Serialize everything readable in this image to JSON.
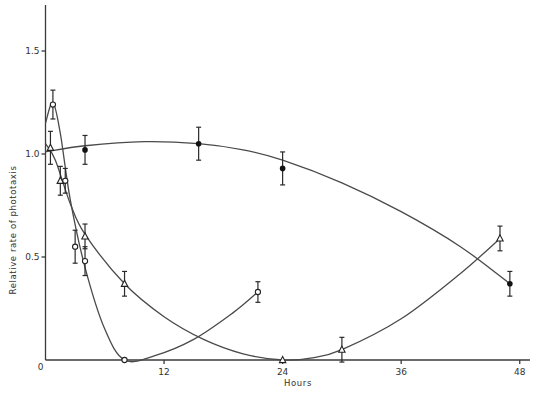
{
  "chart_data": {
    "type": "line",
    "title": "",
    "xlabel": "Hours",
    "ylabel": "Relative rate of phototaxis",
    "xlim": [
      0,
      49
    ],
    "ylim": [
      0,
      1.75
    ],
    "xticks": [
      0,
      12,
      24,
      36,
      48
    ],
    "xtick_labels": [
      "0",
      "12",
      "24",
      "36",
      "48"
    ],
    "yticks": [
      0,
      0.5,
      1.0,
      1.5
    ],
    "ytick_labels": [
      "0",
      "0.5",
      "1.0",
      "1.5"
    ],
    "grid": false,
    "legend": null,
    "series": [
      {
        "name": "open circles",
        "marker": "open-circle",
        "points": [
          {
            "x": 0.75,
            "y": 1.24,
            "err": 0.07
          },
          {
            "x": 2.0,
            "y": 0.87,
            "err": 0.06
          },
          {
            "x": 3.0,
            "y": 0.55,
            "err": 0.08
          },
          {
            "x": 4.0,
            "y": 0.48,
            "err": 0.07
          },
          {
            "x": 8.0,
            "y": 0.0,
            "err": 0.0
          },
          {
            "x": 21.5,
            "y": 0.33,
            "err": 0.05
          }
        ],
        "curve": [
          [
            0,
            1.15
          ],
          [
            0.75,
            1.25
          ],
          [
            1.5,
            1.1
          ],
          [
            2.5,
            0.78
          ],
          [
            4,
            0.45
          ],
          [
            6,
            0.15
          ],
          [
            8,
            0.0
          ],
          [
            11,
            0.02
          ],
          [
            15,
            0.1
          ],
          [
            19,
            0.23
          ],
          [
            21.5,
            0.33
          ]
        ]
      },
      {
        "name": "open triangles",
        "marker": "open-triangle",
        "points": [
          {
            "x": 0.5,
            "y": 1.03,
            "err": 0.08
          },
          {
            "x": 1.5,
            "y": 0.87,
            "err": 0.07
          },
          {
            "x": 4.0,
            "y": 0.6,
            "err": 0.06
          },
          {
            "x": 8.0,
            "y": 0.37,
            "err": 0.06
          },
          {
            "x": 24.0,
            "y": 0.0,
            "err": 0.0
          },
          {
            "x": 30.0,
            "y": 0.05,
            "err": 0.06
          },
          {
            "x": 46.0,
            "y": 0.59,
            "err": 0.06
          }
        ],
        "curve": [
          [
            0,
            1.05
          ],
          [
            1,
            0.97
          ],
          [
            2.5,
            0.76
          ],
          [
            4,
            0.61
          ],
          [
            8,
            0.37
          ],
          [
            12,
            0.21
          ],
          [
            16,
            0.1
          ],
          [
            20,
            0.03
          ],
          [
            24,
            0.0
          ],
          [
            27,
            0.01
          ],
          [
            30,
            0.05
          ],
          [
            36,
            0.2
          ],
          [
            42,
            0.42
          ],
          [
            46,
            0.59
          ]
        ]
      },
      {
        "name": "filled circles",
        "marker": "filled-circle",
        "points": [
          {
            "x": 4.0,
            "y": 1.02,
            "err": 0.07
          },
          {
            "x": 15.5,
            "y": 1.05,
            "err": 0.08
          },
          {
            "x": 24.0,
            "y": 0.93,
            "err": 0.08
          },
          {
            "x": 47.0,
            "y": 0.37,
            "err": 0.06
          }
        ],
        "curve": [
          [
            0,
            1.01
          ],
          [
            4,
            1.04
          ],
          [
            10,
            1.06
          ],
          [
            15.5,
            1.05
          ],
          [
            20,
            1.02
          ],
          [
            24,
            0.97
          ],
          [
            30,
            0.86
          ],
          [
            36,
            0.72
          ],
          [
            42,
            0.55
          ],
          [
            47,
            0.37
          ]
        ]
      }
    ]
  },
  "axes": {
    "xlabel": "Hours",
    "ylabel": "Relative rate of phototaxis",
    "xtick_labels": [
      "0",
      "12",
      "24",
      "36",
      "48"
    ],
    "ytick_labels": [
      "0",
      "0.5",
      "1.0",
      "1.5"
    ]
  }
}
